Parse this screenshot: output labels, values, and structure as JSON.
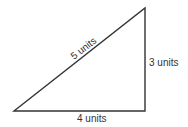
{
  "diagram": {
    "type": "right-triangle",
    "stroke_color": "#333333",
    "background": "#ffffff",
    "vertices": {
      "bottom_left": [
        14,
        111
      ],
      "bottom_right": [
        145,
        111
      ],
      "top_right": [
        145,
        8
      ]
    },
    "labels": {
      "hypotenuse": "5 units",
      "vertical_side": "3 units",
      "base": "4 units"
    }
  }
}
